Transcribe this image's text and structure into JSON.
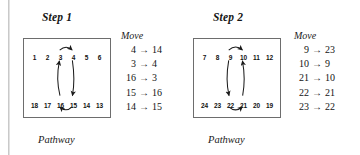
{
  "figure": {
    "caption_label": "Pathway",
    "move_heading": "Move",
    "arrow_glyph": "→"
  },
  "panels": [
    {
      "title": "Step 1",
      "pathway": {
        "caption": "Pathway",
        "top_row": [
          "1",
          "2",
          "3",
          "4",
          "5",
          "6"
        ],
        "bottom_row": [
          "18",
          "17",
          "16",
          "15",
          "14",
          "13"
        ],
        "arrows": [
          {
            "name": "top-arc-3-to-4",
            "from": "3",
            "to": "4",
            "direction": "right",
            "location": "top-row-above"
          },
          {
            "name": "down-arc-4-to-15",
            "from": "4",
            "to": "15",
            "direction": "down",
            "location": "interior-right"
          },
          {
            "name": "up-arc-16-to-3",
            "from": "16",
            "to": "3",
            "direction": "up",
            "location": "interior-left"
          },
          {
            "name": "bottom-arc-15-to-16",
            "from": "15",
            "to": "16",
            "direction": "left",
            "location": "bottom-row-below"
          }
        ]
      },
      "moves": [
        {
          "from": "4",
          "to": "14"
        },
        {
          "from": "3",
          "to": "4"
        },
        {
          "from": "16",
          "to": "3"
        },
        {
          "from": "15",
          "to": "16"
        },
        {
          "from": "14",
          "to": "15"
        }
      ]
    },
    {
      "title": "Step 2",
      "pathway": {
        "caption": "Pathway",
        "top_row": [
          "7",
          "8",
          "9",
          "10",
          "11",
          "12"
        ],
        "bottom_row": [
          "24",
          "23",
          "22",
          "21",
          "20",
          "19"
        ],
        "arrows": [
          {
            "name": "top-arc-9-to-10",
            "from": "9",
            "to": "10",
            "direction": "right",
            "location": "top-row-above"
          },
          {
            "name": "down-arc-9-to-22",
            "from": "9",
            "to": "22",
            "direction": "down",
            "location": "interior-left"
          },
          {
            "name": "up-arc-21-to-10",
            "from": "21",
            "to": "10",
            "direction": "up",
            "location": "interior-right"
          },
          {
            "name": "bottom-arc-22-to-21",
            "from": "22",
            "to": "21",
            "direction": "right",
            "location": "bottom-row-below"
          }
        ]
      },
      "moves": [
        {
          "from": "9",
          "to": "23"
        },
        {
          "from": "10",
          "to": "9"
        },
        {
          "from": "21",
          "to": "10"
        },
        {
          "from": "22",
          "to": "21"
        },
        {
          "from": "23",
          "to": "22"
        }
      ]
    }
  ],
  "colors": {
    "ink": "#141414",
    "box_border": "#6d6d6d",
    "arrow": "#1a1a1a",
    "page": "#ffffff",
    "scan_artifact": "#c9c9c9"
  }
}
